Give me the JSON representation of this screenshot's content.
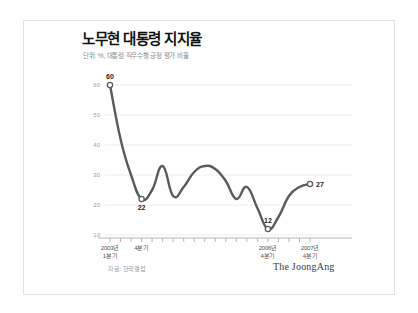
{
  "card": {
    "title": "노무현 대통령 지지율",
    "subtitle": "단위: %, 대통령 직무수행 긍정 평가 비율",
    "source": "자료: 한국갤럽",
    "brand": "The JoongAng"
  },
  "colors": {
    "line": "#5a5a5a",
    "grid": "#ededed",
    "axis": "#b0b0b0",
    "tick_text": "#9d9d9d",
    "label_text": "#1f1f1f",
    "card_border": "#e2e2e2",
    "background": "#ffffff"
  },
  "chart_data": {
    "type": "line",
    "title": "노무현 대통령 지지율",
    "subtitle": "단위: %, 대통령 직무수행 긍정 평가 비율",
    "xlabel": "",
    "ylabel": "",
    "ylim": [
      10,
      60
    ],
    "yticks": [
      10,
      20,
      30,
      40,
      50,
      60
    ],
    "ytick_labels": [
      "10",
      "20",
      "30",
      "40",
      "50",
      "60"
    ],
    "grid": true,
    "legend": false,
    "categories": [
      "2003년 1분기",
      "2003년 2분기",
      "2003년 3분기",
      "2003년 4분기",
      "2004년 1분기",
      "2004년 2분기",
      "2004년 3분기",
      "2004년 4분기",
      "2005년 1분기",
      "2005년 2분기",
      "2005년 3분기",
      "2005년 4분기",
      "2006년 1분기",
      "2006년 2분기",
      "2006년 3분기",
      "2006년 4분기",
      "2007년 1분기",
      "2007년 2분기",
      "2007년 3분기",
      "2007년 4분기"
    ],
    "values": [
      60,
      42,
      30,
      22,
      25,
      33,
      23,
      26,
      31,
      33,
      32,
      28,
      22,
      26,
      19,
      12,
      16,
      23,
      26,
      27
    ],
    "annotations": [
      {
        "index": 0,
        "value": 60,
        "label": "60",
        "marker": "open-circle",
        "position": "above"
      },
      {
        "index": 3,
        "value": 22,
        "label": "22",
        "marker": "open-circle",
        "position": "below"
      },
      {
        "index": 15,
        "value": 12,
        "label": "12",
        "marker": "open-circle",
        "position": "above"
      },
      {
        "index": 19,
        "value": 27,
        "label": "27",
        "marker": "open-circle",
        "position": "right"
      }
    ],
    "xtick_labels": [
      {
        "index": 0,
        "line1": "2003년",
        "line2": "1분기"
      },
      {
        "index": 3,
        "line1": "4분기",
        "line2": ""
      },
      {
        "index": 15,
        "line1": "2006년",
        "line2": "4분기"
      },
      {
        "index": 19,
        "line1": "2007년",
        "line2": "4분기"
      }
    ]
  }
}
